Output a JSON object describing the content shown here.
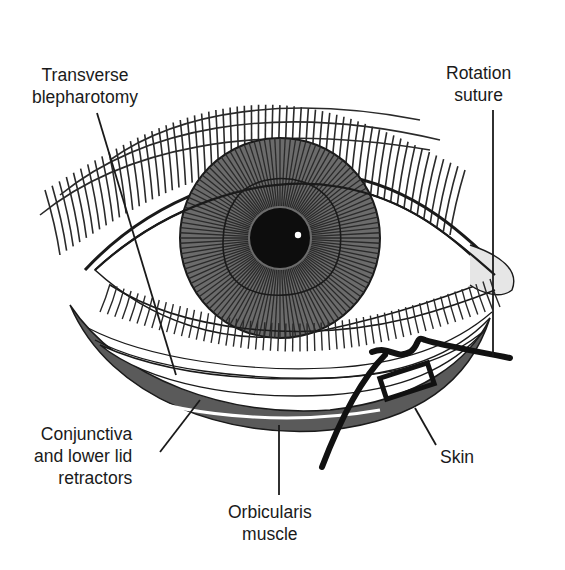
{
  "figure": {
    "type": "anatomical surgical illustration",
    "colors": {
      "ink": "#1a1a1a",
      "iris_gray": "#6f6f6f",
      "muscle_gray": "#555555",
      "background": "#ffffff"
    }
  },
  "labels": {
    "transverse_blepharotomy": {
      "line1": "Transverse",
      "line2": "blepharotomy"
    },
    "rotation_suture": {
      "line1": "Rotation",
      "line2": "suture"
    },
    "conjunctiva": {
      "line1": "Conjunctiva",
      "line2": "and lower lid",
      "line3": "retractors"
    },
    "orbicularis": {
      "line1": "Orbicularis",
      "line2": "muscle"
    },
    "skin": {
      "line1": "Skin"
    }
  }
}
